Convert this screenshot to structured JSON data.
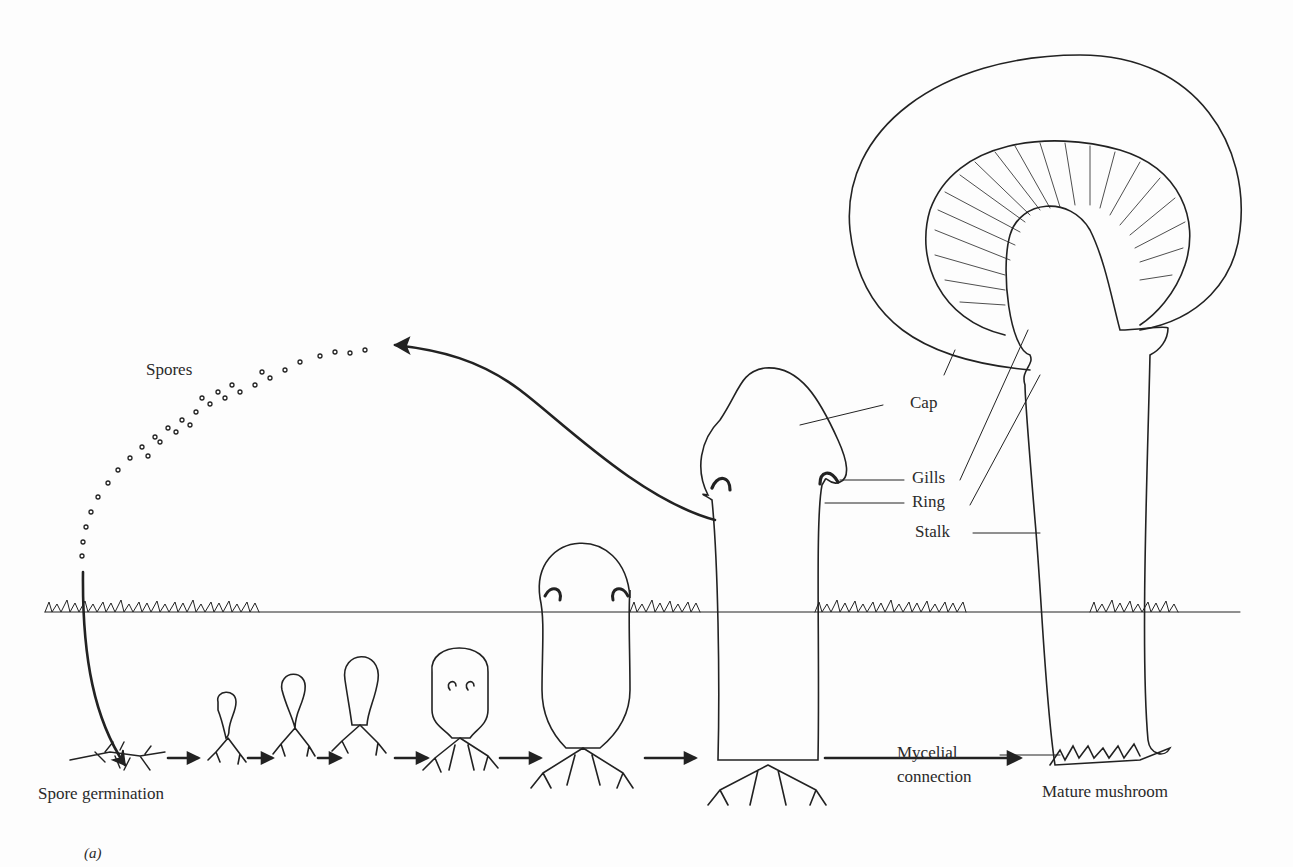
{
  "figure": {
    "panel_label": "(a)",
    "labels": {
      "spores": "Spores",
      "cap": "Cap",
      "gills": "Gills",
      "ring": "Ring",
      "stalk": "Stalk",
      "spore_germination": "Spore germination",
      "mycelial_1": "Mycelial",
      "mycelial_2": "connection",
      "mature": "Mature mushroom"
    },
    "stages": [
      "Spore germination",
      "Button stage 1",
      "Button stage 2",
      "Button stage 3",
      "Button stage 4",
      "Young fruiting body",
      "Elongating fruiting body",
      "Mature mushroom"
    ]
  }
}
